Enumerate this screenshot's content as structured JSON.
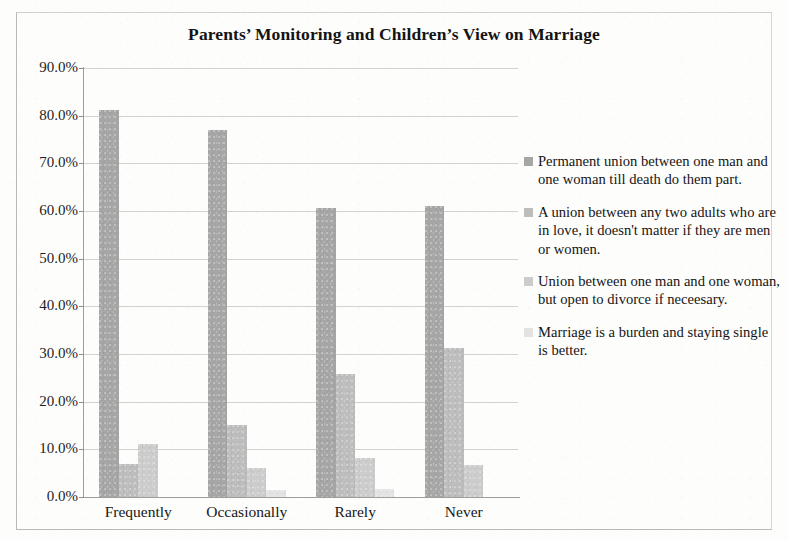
{
  "chart_data": {
    "type": "bar",
    "title": "Parents’ Monitoring and Children’s View on Marriage",
    "xlabel": "",
    "ylabel": "",
    "ylim": [
      0,
      90
    ],
    "ytick_labels": [
      "0.0%",
      "10.0%",
      "20.0%",
      "30.0%",
      "40.0%",
      "50.0%",
      "60.0%",
      "70.0%",
      "80.0%",
      "90.0%"
    ],
    "ytick_values": [
      0,
      10,
      20,
      30,
      40,
      50,
      60,
      70,
      80,
      90
    ],
    "grid": true,
    "legend_position": "right",
    "categories": [
      "Frequently",
      "Occasionally",
      "Rarely",
      "Never"
    ],
    "series": [
      {
        "name": "Permanent union between one man and one woman till death do them part.",
        "color": "#a6a6a6",
        "values": [
          81.2,
          77.0,
          60.6,
          61.0
        ]
      },
      {
        "name": "A union between any two adults who are in love, it doesn't matter if they are men or women.",
        "color": "#bdbdbd",
        "values": [
          7.0,
          15.2,
          25.8,
          31.3
        ]
      },
      {
        "name": "Union between one man and one woman, but open to divorce if neceesary.",
        "color": "#cccccc",
        "values": [
          11.2,
          6.0,
          8.1,
          6.8
        ]
      },
      {
        "name": "Marriage is a burden and staying single is better.",
        "color": "#e3e3e3",
        "values": [
          0.0,
          1.5,
          1.6,
          0.0
        ]
      }
    ]
  },
  "legend": {
    "items": [
      {
        "label": "Permanent union between one man and one woman till death do them part.",
        "color": "#a6a6a6"
      },
      {
        "label": "A union between any two adults who are in love, it doesn't matter if they are men or women.",
        "color": "#bdbdbd"
      },
      {
        "label": "Union between one man and one woman, but open to divorce if neceesary.",
        "color": "#cccccc"
      },
      {
        "label": "Marriage is a burden and staying single is better.",
        "color": "#e3e3e3"
      }
    ]
  },
  "colors": {
    "axis": "#9e9e9a",
    "grid": "#d2d2ce",
    "frame": "#b9b9b5",
    "text": "#151515",
    "background": "#fdfdfc"
  }
}
